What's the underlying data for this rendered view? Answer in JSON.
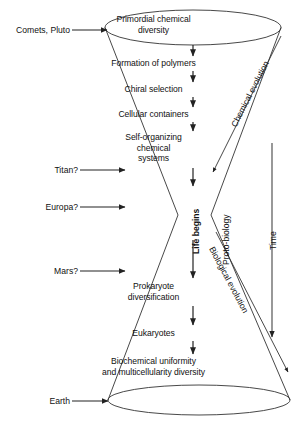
{
  "figure": {
    "type": "hourglass-cone-diagram",
    "title_note": "Evolution of chemical to biological diversity hourglass",
    "background_color": "#ffffff",
    "line_color": "#333333",
    "text_color": "#111111"
  },
  "center_stages": [
    {
      "id": "stage-primordial",
      "text": "Primordial chemical\ndiversity",
      "y": 16
    },
    {
      "id": "stage-polymers",
      "text": "Formation of polymers",
      "y": 59
    },
    {
      "id": "stage-chiral",
      "text": "Chiral selection",
      "y": 85
    },
    {
      "id": "stage-cellular",
      "text": "Cellular containers",
      "y": 110
    },
    {
      "id": "stage-self-organizing",
      "text": "Self-organizing\nchemical\nsystems",
      "y": 133
    },
    {
      "id": "stage-prokaryote",
      "text": "Prokaryote\ndiversification",
      "y": 283
    },
    {
      "id": "stage-eukaryotes",
      "text": "Eukaryotes",
      "y": 330
    },
    {
      "id": "stage-biochemical",
      "text": "Biochemical uniformity\nand multicellularity diversity",
      "y": 358
    }
  ],
  "side_sources": [
    {
      "id": "source-comets-pluto",
      "label": "Comets, Pluto",
      "y": 30
    },
    {
      "id": "source-titan",
      "label": "Titan?",
      "y": 170
    },
    {
      "id": "source-europa",
      "label": "Europa?",
      "y": 207
    },
    {
      "id": "source-mars",
      "label": "Mars?",
      "y": 271
    },
    {
      "id": "source-earth",
      "label": "Earth",
      "y": 401
    }
  ],
  "vertical_labels": [
    {
      "id": "label-life-begins",
      "text": "Life begins",
      "bold": true
    },
    {
      "id": "label-proto-biology",
      "text": "Proto-biology",
      "bold": false
    },
    {
      "id": "label-time",
      "text": "Time",
      "bold": false
    }
  ],
  "diagonal_labels": [
    {
      "id": "label-chemical-evolution",
      "text": "Chemical evolution"
    },
    {
      "id": "label-biological-evolution",
      "text": "Biological evolution"
    }
  ],
  "arrows": {
    "time_axis": {
      "from_y": 143,
      "to_y": 337,
      "x": 272,
      "direction": "down"
    },
    "chemical_evolution": {
      "direction": "down-left"
    },
    "biological_evolution": {
      "direction": "down-right"
    }
  }
}
